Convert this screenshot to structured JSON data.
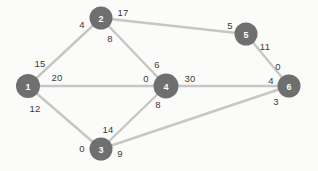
{
  "diagram": {
    "background_color": "#fbfbfa",
    "node_color": "#6f6f6f",
    "node_text_color": "#ffffff",
    "edge_color": "#c6c6c4",
    "weight_text_color": "#3a3a3a"
  },
  "nodes": [
    {
      "id": "1",
      "label": "1",
      "cx": 28,
      "cy": 86,
      "r": 12
    },
    {
      "id": "2",
      "label": "2",
      "cx": 101,
      "cy": 18,
      "r": 11.5
    },
    {
      "id": "3",
      "label": "3",
      "cx": 101,
      "cy": 149,
      "r": 11.5
    },
    {
      "id": "4",
      "label": "4",
      "cx": 166,
      "cy": 86,
      "r": 12.5
    },
    {
      "id": "5",
      "label": "5",
      "cx": 246,
      "cy": 34,
      "r": 11.5
    },
    {
      "id": "6",
      "label": "6",
      "cx": 289,
      "cy": 86,
      "r": 11.5
    }
  ],
  "edges": [
    {
      "from": "1",
      "to": "2",
      "from_weight": "15",
      "to_weight": "4"
    },
    {
      "from": "1",
      "to": "4",
      "from_weight": "20",
      "to_weight": "0"
    },
    {
      "from": "1",
      "to": "3",
      "from_weight": "12",
      "to_weight": "0"
    },
    {
      "from": "2",
      "to": "4",
      "from_weight": "8",
      "to_weight": "6"
    },
    {
      "from": "2",
      "to": "5",
      "from_weight": "17",
      "to_weight": "5"
    },
    {
      "from": "5",
      "to": "6",
      "from_weight": "11",
      "to_weight": "0"
    },
    {
      "from": "4",
      "to": "6",
      "from_weight": "30",
      "to_weight": "4"
    },
    {
      "from": "4",
      "to": "3",
      "from_weight": "8",
      "to_weight": "14"
    },
    {
      "from": "3",
      "to": "6",
      "from_weight": "9",
      "to_weight": "3"
    }
  ],
  "weight_labels": [
    {
      "name": "weight-1-2-near-1",
      "text": "15",
      "x": 40,
      "y": 63
    },
    {
      "name": "weight-1-2-near-2",
      "text": "4",
      "x": 82,
      "y": 24
    },
    {
      "name": "weight-2-5-near-2",
      "text": "17",
      "x": 123,
      "y": 12
    },
    {
      "name": "weight-2-5-near-5",
      "text": "5",
      "x": 230,
      "y": 25
    },
    {
      "name": "weight-2-4-near-2",
      "text": "8",
      "x": 110,
      "y": 38
    },
    {
      "name": "weight-2-4-near-4",
      "text": "6",
      "x": 157,
      "y": 64
    },
    {
      "name": "weight-1-4-near-1",
      "text": "20",
      "x": 57,
      "y": 77
    },
    {
      "name": "weight-1-4-near-4",
      "text": "0",
      "x": 146,
      "y": 78
    },
    {
      "name": "weight-4-6-near-4",
      "text": "30",
      "x": 190,
      "y": 78
    },
    {
      "name": "weight-4-6-near-6",
      "text": "4",
      "x": 271,
      "y": 80
    },
    {
      "name": "weight-5-6-near-5",
      "text": "11",
      "x": 265,
      "y": 46
    },
    {
      "name": "weight-5-6-near-6",
      "text": "0",
      "x": 278,
      "y": 66
    },
    {
      "name": "weight-1-3-near-1",
      "text": "12",
      "x": 35,
      "y": 108
    },
    {
      "name": "weight-1-3-near-3",
      "text": "0",
      "x": 82,
      "y": 148
    },
    {
      "name": "weight-4-3-near-4",
      "text": "8",
      "x": 158,
      "y": 104
    },
    {
      "name": "weight-4-3-near-3",
      "text": "14",
      "x": 108,
      "y": 129
    },
    {
      "name": "weight-3-6-near-3",
      "text": "9",
      "x": 120,
      "y": 153
    },
    {
      "name": "weight-3-6-near-6",
      "text": "3",
      "x": 276,
      "y": 101
    }
  ]
}
